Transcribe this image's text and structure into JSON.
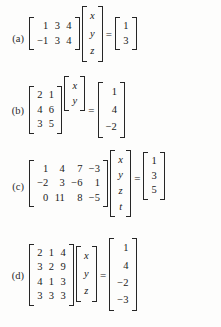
{
  "page": {
    "background_color": "#fdfdfc",
    "text_color": "#202020",
    "equals_sign": "="
  },
  "problems": [
    {
      "label": "(a)",
      "coefficient_matrix": [
        [
          "1",
          "3",
          "4"
        ],
        [
          "−1",
          "3",
          "4"
        ]
      ],
      "unknown_vector": [
        "x",
        "y",
        "z"
      ],
      "rhs_vector": [
        "1",
        "3"
      ]
    },
    {
      "label": "(b)",
      "coefficient_matrix": [
        [
          "2",
          "1"
        ],
        [
          "4",
          "6"
        ],
        [
          "3",
          "5"
        ]
      ],
      "unknown_vector": [
        "x",
        "y"
      ],
      "rhs_vector": [
        "1",
        "4",
        "−2"
      ]
    },
    {
      "label": "(c)",
      "coefficient_matrix": [
        [
          "1",
          "4",
          "7",
          "−3"
        ],
        [
          "−2",
          "3",
          "−6",
          "1"
        ],
        [
          "0",
          "11",
          "8",
          "−5"
        ]
      ],
      "unknown_vector": [
        "x",
        "y",
        "z",
        "t"
      ],
      "rhs_vector": [
        "1",
        "3",
        "5"
      ]
    },
    {
      "label": "(d)",
      "coefficient_matrix": [
        [
          "2",
          "1",
          "4"
        ],
        [
          "3",
          "2",
          "9"
        ],
        [
          "4",
          "1",
          "3"
        ],
        [
          "3",
          "3",
          "3"
        ]
      ],
      "unknown_vector": [
        "x",
        "y",
        "z"
      ],
      "rhs_vector": [
        "1",
        "4",
        "−2",
        "−3"
      ]
    }
  ]
}
